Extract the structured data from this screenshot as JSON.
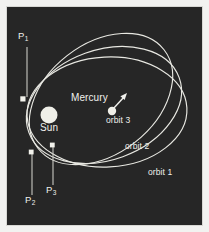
{
  "figure": {
    "background_color": "#262626",
    "frame_color": "#d8d8d4",
    "page_color": "#f2f2f0",
    "line_color": "#e8e8e2",
    "text_color": "#f0f0ec",
    "width": 209,
    "height": 232
  },
  "bodies": {
    "sun": {
      "label": "Sun",
      "color": "#efefe8",
      "cx": 42,
      "cy": 108,
      "r": 8.5,
      "label_x": 33,
      "label_y": 122
    },
    "mercury": {
      "label": "Mercury",
      "color": "#efefe8",
      "cx": 105,
      "cy": 104,
      "r": 4.2,
      "label_x": 64,
      "label_y": 92
    }
  },
  "velocity_arrow": {
    "name": "mercury-velocity-arrow",
    "from_x": 107,
    "from_y": 101,
    "to_x": 119,
    "to_y": 88
  },
  "orbits": [
    {
      "id": "orbit-1",
      "label": "orbit 1",
      "label_x": 141,
      "label_y": 165,
      "cx": 100,
      "cy": 105,
      "rx": 80,
      "ry": 55,
      "rotation": -3
    },
    {
      "id": "orbit-2",
      "label": "orbit 2",
      "label_x": 118,
      "label_y": 139,
      "cx": 97,
      "cy": 98,
      "rx": 80,
      "ry": 55,
      "rotation": -20
    },
    {
      "id": "orbit-3",
      "label": "orbit 3",
      "label_x": 99,
      "label_y": 113,
      "cx": 94,
      "cy": 92,
      "rx": 80,
      "ry": 55,
      "rotation": -38
    }
  ],
  "perihelia": [
    {
      "id": "P1",
      "label": "P",
      "subscript": "1",
      "marker_x": 16,
      "marker_y": 92,
      "leader_x": 20,
      "leader_top": 40,
      "leader_bottom": 90,
      "label_x": 11,
      "label_y": 28
    },
    {
      "id": "P2",
      "label": "P",
      "subscript": "2",
      "marker_x": 24,
      "marker_y": 145,
      "leader_x": 25,
      "leader_top": 147,
      "leader_bottom": 188,
      "label_x": 18,
      "label_y": 192
    },
    {
      "id": "P3",
      "label": "P",
      "subscript": "3",
      "marker_x": 45,
      "marker_y": 138,
      "leader_x": 46,
      "leader_top": 140,
      "leader_bottom": 178,
      "label_x": 39,
      "label_y": 182
    }
  ]
}
